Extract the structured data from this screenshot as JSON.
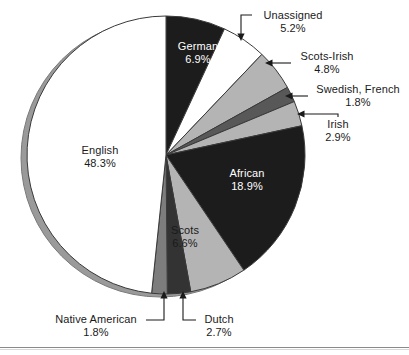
{
  "chart_data": {
    "type": "pie",
    "title": "",
    "subtitle": "",
    "xlabel": "",
    "ylabel": "",
    "legend_position": "none",
    "grid": false,
    "start_angle_deg": 0,
    "direction": "clockwise",
    "unit": "%",
    "categories": [
      "German",
      "Unassigned",
      "Scots-Irish",
      "Swedish, French",
      "Irish",
      "African",
      "Scots",
      "Dutch",
      "Native American",
      "English"
    ],
    "values": [
      6.9,
      5.2,
      4.8,
      1.8,
      2.9,
      18.9,
      6.6,
      2.7,
      1.8,
      48.3
    ],
    "slices": [
      {
        "label": "German",
        "value": 6.9,
        "value_text": "6.9%",
        "color": "#1c1c1c",
        "text_color": "#ffffff",
        "label_placement": "inside"
      },
      {
        "label": "Unassigned",
        "value": 5.2,
        "value_text": "5.2%",
        "color": "#ffffff",
        "text_color": "#1a1a1a",
        "label_placement": "callout"
      },
      {
        "label": "Scots-Irish",
        "value": 4.8,
        "value_text": "4.8%",
        "color": "#b4b4b4",
        "text_color": "#1a1a1a",
        "label_placement": "callout"
      },
      {
        "label": "Swedish, French",
        "value": 1.8,
        "value_text": "1.8%",
        "color": "#585858",
        "text_color": "#1a1a1a",
        "label_placement": "callout"
      },
      {
        "label": "Irish",
        "value": 2.9,
        "value_text": "2.9%",
        "color": "#b4b4b4",
        "text_color": "#1a1a1a",
        "label_placement": "callout"
      },
      {
        "label": "African",
        "value": 18.9,
        "value_text": "18.9%",
        "color": "#1c1c1c",
        "text_color": "#ffffff",
        "label_placement": "inside"
      },
      {
        "label": "Scots",
        "value": 6.6,
        "value_text": "6.6%",
        "color": "#b4b4b4",
        "text_color": "#1a1a1a",
        "label_placement": "inside"
      },
      {
        "label": "Dutch",
        "value": 2.7,
        "value_text": "2.7%",
        "color": "#333333",
        "text_color": "#1a1a1a",
        "label_placement": "callout"
      },
      {
        "label": "Native American",
        "value": 1.8,
        "value_text": "1.8%",
        "color": "#7d7d7d",
        "text_color": "#1a1a1a",
        "label_placement": "callout"
      },
      {
        "label": "English",
        "value": 48.3,
        "value_text": "48.3%",
        "color": "#ffffff",
        "text_color": "#1a1a1a",
        "label_placement": "inside"
      }
    ]
  },
  "labels": {
    "german": {
      "name": "German",
      "pct": "6.9%"
    },
    "unassigned": {
      "name": "Unassigned",
      "pct": "5.2%"
    },
    "scots_irish": {
      "name": "Scots-Irish",
      "pct": "4.8%"
    },
    "swedish_french": {
      "name": "Swedish, French",
      "pct": "1.8%"
    },
    "irish": {
      "name": "Irish",
      "pct": "2.9%"
    },
    "african": {
      "name": "African",
      "pct": "18.9%"
    },
    "scots": {
      "name": "Scots",
      "pct": "6.6%"
    },
    "dutch": {
      "name": "Dutch",
      "pct": "2.7%"
    },
    "native_american": {
      "name": "Native American",
      "pct": "1.8%"
    },
    "english": {
      "name": "English",
      "pct": "48.3%"
    }
  },
  "colors": {
    "black_slice": "#1c1c1c",
    "dark_gray_slice": "#585858",
    "mid_gray_slice": "#7d7d7d",
    "light_gray_slice": "#b4b4b4",
    "white_slice": "#ffffff",
    "rim_shadow": "#9a9a9a",
    "outline": "#3a3a3a",
    "leader_line": "#1a1a1a",
    "page_background": "#ffffff",
    "bottom_rule": "#8a8a8a"
  }
}
